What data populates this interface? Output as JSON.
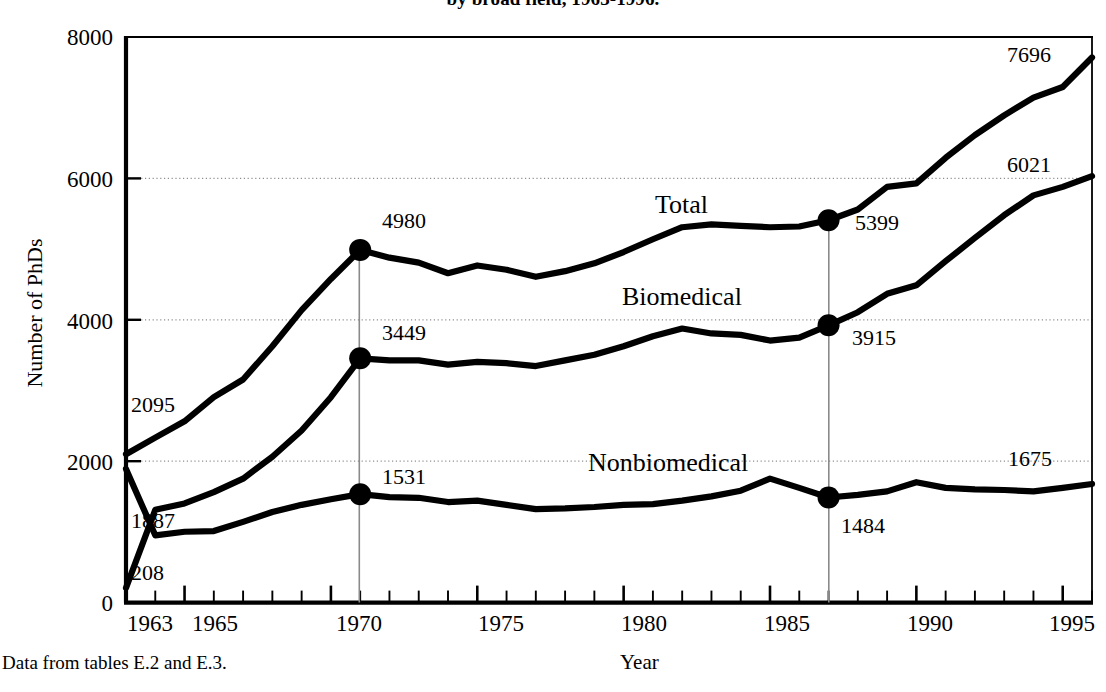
{
  "title": "by broad field, 1963-1996.",
  "footnote": "Data from tables E.2 and E.3.",
  "axis": {
    "ylabel": "Number of PhDs",
    "xlabel": "Year"
  },
  "series_labels": {
    "total": "Total",
    "biomedical": "Biomedical",
    "nonbiomedical": "Nonbiomedical"
  },
  "chart_data": {
    "type": "line",
    "title": "by broad field, 1963-1996.",
    "xlabel": "Year",
    "ylabel": "Number of PhDs",
    "xlim": [
      1963,
      1996
    ],
    "ylim": [
      0,
      8000
    ],
    "ytick_labels": [
      "0",
      "2000",
      "4000",
      "6000",
      "8000"
    ],
    "yticks": [
      0,
      2000,
      4000,
      6000,
      8000
    ],
    "xtick_labels": [
      "1963",
      "1965",
      "1970",
      "1975",
      "1980",
      "1985",
      "1990",
      "1995"
    ],
    "xticks": [
      1963,
      1965,
      1970,
      1975,
      1980,
      1985,
      1990,
      1995
    ],
    "minor_xticks_every": 1,
    "grid": "horizontal dotted at 2000, 4000, 6000",
    "legend": "inline series labels on plot",
    "x": [
      1963,
      1964,
      1965,
      1966,
      1967,
      1968,
      1969,
      1970,
      1971,
      1972,
      1973,
      1974,
      1975,
      1976,
      1977,
      1978,
      1979,
      1980,
      1981,
      1982,
      1983,
      1984,
      1985,
      1986,
      1987,
      1988,
      1989,
      1990,
      1991,
      1992,
      1993,
      1994,
      1995,
      1996
    ],
    "series": [
      {
        "name": "Total",
        "values": [
          2095,
          2330,
          2560,
          2900,
          3150,
          3620,
          4130,
          4570,
          4980,
          4870,
          4800,
          4650,
          4760,
          4700,
          4600,
          4680,
          4790,
          4950,
          5130,
          5300,
          5340,
          5320,
          5300,
          5310,
          5399,
          5550,
          5870,
          5920,
          6280,
          6600,
          6880,
          7130,
          7280,
          7696
        ]
      },
      {
        "name": "Biomedical",
        "values": [
          208,
          1310,
          1400,
          1560,
          1750,
          2060,
          2430,
          2900,
          3449,
          3420,
          3420,
          3360,
          3400,
          3380,
          3340,
          3420,
          3500,
          3620,
          3760,
          3870,
          3800,
          3780,
          3700,
          3740,
          3915,
          4100,
          4360,
          4480,
          4820,
          5150,
          5470,
          5750,
          5870,
          6021
        ]
      },
      {
        "name": "Nonbiomedical",
        "values": [
          1887,
          950,
          1000,
          1010,
          1140,
          1280,
          1380,
          1460,
          1531,
          1490,
          1480,
          1420,
          1440,
          1380,
          1320,
          1330,
          1350,
          1380,
          1390,
          1440,
          1500,
          1580,
          1750,
          1620,
          1484,
          1520,
          1570,
          1700,
          1620,
          1600,
          1590,
          1570,
          1620,
          1675
        ]
      }
    ],
    "marked_points": [
      {
        "year": 1971,
        "total": 4980,
        "biomedical": 3449,
        "nonbiomedical": 1531
      },
      {
        "year": 1987,
        "total": 5399,
        "biomedical": 3915,
        "nonbiomedical": 1484
      }
    ],
    "endpoint_labels": {
      "left_1963": {
        "total": "2095",
        "nonbiomedical": "1887",
        "biomedical": "208"
      },
      "right_1996": {
        "total": "7696",
        "biomedical": "6021",
        "nonbiomedical": "1675"
      }
    },
    "data_labels": [
      "2095",
      "1887",
      "208",
      "4980",
      "3449",
      "1531",
      "5399",
      "3915",
      "1484",
      "7696",
      "6021",
      "1675"
    ]
  },
  "value_labels": {
    "l2095": "2095",
    "l1887": "1887",
    "l208": "208",
    "l4980": "4980",
    "l3449": "3449",
    "l1531": "1531",
    "l5399": "5399",
    "l3915": "3915",
    "l1484": "1484",
    "l7696": "7696",
    "l6021": "6021",
    "l1675": "1675"
  },
  "ytick_labels": {
    "t0": "0",
    "t2000": "2000",
    "t4000": "4000",
    "t6000": "6000",
    "t8000": "8000"
  },
  "xtick_labels": {
    "x1963": "1963",
    "x1965": "1965",
    "x1970": "1970",
    "x1975": "1975",
    "x1980": "1980",
    "x1985": "1985",
    "x1990": "1990",
    "x1995": "1995"
  },
  "colors": {
    "line": "#000000",
    "grid": "#9a9a9a",
    "refline": "#8c8c8c",
    "axis": "#000000"
  }
}
